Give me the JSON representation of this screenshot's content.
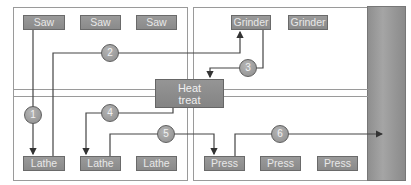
{
  "diagram": {
    "type": "process-layout-flow",
    "colors": {
      "machine_fill": "#909090",
      "flow_line": "#444444",
      "wall_band": "#999999",
      "panel_border": "#9a9a9a"
    },
    "machines": {
      "saws": [
        "Saw",
        "Saw",
        "Saw"
      ],
      "grinders": [
        "Grinder",
        "Grinder"
      ],
      "heat_treat": [
        "Heat",
        "treat"
      ],
      "lathes": [
        "Lathe",
        "Lathe",
        "Lathe"
      ],
      "presses": [
        "Press",
        "Press",
        "Press"
      ]
    },
    "steps": [
      "1",
      "2",
      "3",
      "4",
      "5",
      "6"
    ],
    "flows": [
      {
        "step": "1",
        "from": "Saw",
        "to": "Lathe"
      },
      {
        "step": "2",
        "from": "Lathe",
        "to": "Grinder"
      },
      {
        "step": "3",
        "from": "Grinder",
        "to": "Heat treat"
      },
      {
        "step": "4",
        "from": "Heat treat",
        "to": "Lathe"
      },
      {
        "step": "5",
        "from": "Lathe",
        "to": "Press"
      },
      {
        "step": "6",
        "from": "Press",
        "to": "Shipping wall"
      }
    ]
  }
}
